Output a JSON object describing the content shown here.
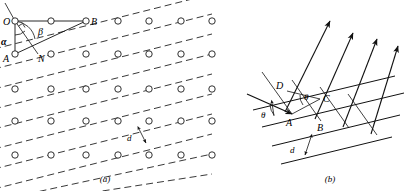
{
  "figure": {
    "panels": [
      {
        "id": "a",
        "caption": "(a)",
        "description": "Lattice of atoms with a family of parallel planes and construction triangle",
        "labels": {
          "origin": "O",
          "vertex_b": "B",
          "vertex_a": "A",
          "foot_n": "N",
          "angle_alpha": "α",
          "angle_beta": "β",
          "spacing": "d"
        },
        "lattice": {
          "columns": 7,
          "rows": 5,
          "col_spacing_px": 96,
          "row_spacing_px": 97
        }
      },
      {
        "id": "b",
        "caption": "(b)",
        "description": "Incident and reflected X-ray beams on successive lattice planes showing path difference",
        "labels": {
          "point_a": "A",
          "point_b": "B",
          "point_c": "C",
          "point_d": "D",
          "angle_incident": "θ",
          "angle_path": "θ",
          "spacing": "d"
        },
        "rays": {
          "incident_count": 1,
          "reflected_count": 4,
          "plane_count": 4
        }
      }
    ],
    "colors": {
      "ink": "#111111",
      "dot_stroke": "#1a1a1a",
      "background": "#ffffff"
    }
  }
}
